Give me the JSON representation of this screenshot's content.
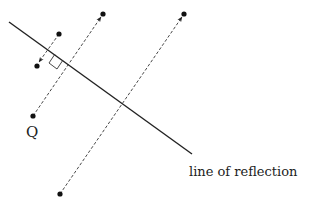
{
  "diagram": {
    "type": "geometric reflection",
    "colors": {
      "ink": "#222222",
      "background": "#ffffff"
    },
    "labels": {
      "point_q": "Q",
      "mirror_line": "line of reflection"
    },
    "mirror_line": {
      "x1": 9,
      "y1": 22,
      "x2": 192,
      "y2": 154
    },
    "points": [
      {
        "id": "Q",
        "x": 33,
        "y": 116
      },
      {
        "id": "top-left",
        "x": 59,
        "y": 34
      },
      {
        "id": "reflected-small",
        "x": 37,
        "y": 66
      },
      {
        "id": "top-middle",
        "x": 103,
        "y": 14
      },
      {
        "id": "top-right",
        "x": 184,
        "y": 14
      },
      {
        "id": "bottom",
        "x": 60,
        "y": 194
      }
    ],
    "dashed_arrows": [
      {
        "from": [
          33,
          116
        ],
        "to": [
          101,
          17
        ]
      },
      {
        "from": [
          59,
          34
        ],
        "to": [
          38,
          63
        ]
      },
      {
        "from": [
          60,
          194
        ],
        "to": [
          182,
          17
        ]
      }
    ]
  }
}
